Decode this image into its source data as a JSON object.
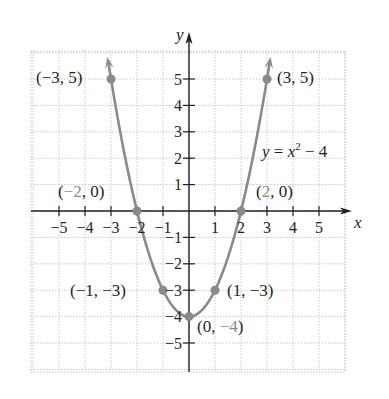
{
  "chart_data": {
    "type": "line",
    "title": "",
    "equation_label": "y = x² − 4",
    "equation": {
      "lhs": "y = x",
      "exp": "2",
      "rhs": " − 4"
    },
    "xlabel": "x",
    "ylabel": "y",
    "xlim": [
      -5.5,
      6
    ],
    "ylim": [
      -5.5,
      6
    ],
    "grid": true,
    "x_ticks": [
      -5,
      -4,
      -3,
      -2,
      -1,
      1,
      2,
      3,
      4,
      5
    ],
    "y_ticks": [
      -5,
      -4,
      -3,
      -2,
      -1,
      1,
      2,
      3,
      4,
      5
    ],
    "x_tick_labels": [
      "−5",
      "−4",
      "−3",
      "−2",
      "−1",
      "1",
      "2",
      "3",
      "4",
      "5"
    ],
    "y_tick_labels": [
      "−5",
      "−4",
      "−3",
      "−2",
      "−1",
      "1",
      "2",
      "3",
      "4",
      "5"
    ],
    "series": [
      {
        "name": "y = x^2 - 4",
        "function": "x^2 - 4",
        "x_range": [
          -3.1,
          3.1
        ],
        "color": "#8a8a8a"
      }
    ],
    "points": [
      {
        "x": -3,
        "y": 5,
        "label": "(−3, 5)"
      },
      {
        "x": -2,
        "y": 0,
        "label": "(−2, 0)"
      },
      {
        "x": -1,
        "y": -3,
        "label": "(−1, −3)"
      },
      {
        "x": 0,
        "y": -4,
        "label": "(0, −4)"
      },
      {
        "x": 1,
        "y": -3,
        "label": "(1, −3)"
      },
      {
        "x": 2,
        "y": 0,
        "label": "(2, 0)"
      },
      {
        "x": 3,
        "y": 5,
        "label": "(3, 5)"
      }
    ],
    "colors": {
      "curve": "#8a8a8a",
      "axis": "#231f20",
      "grid": "#c8c8c8",
      "point": "#8a8a8a"
    }
  }
}
